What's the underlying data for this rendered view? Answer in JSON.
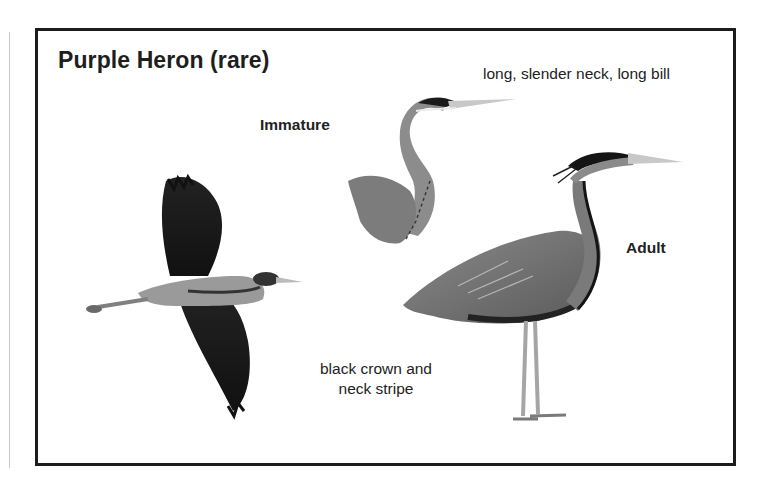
{
  "panel": {
    "title": "Purple Heron (rare)",
    "labels": {
      "immature": "Immature",
      "neck_note": "long, slender neck, long bill",
      "adult": "Adult",
      "crown_note_line1": "black crown and",
      "crown_note_line2": "neck stripe"
    },
    "figures": [
      {
        "name": "flying-heron",
        "description": "Purple heron in flight"
      },
      {
        "name": "immature-heron",
        "description": "Immature purple heron head and neck"
      },
      {
        "name": "adult-heron",
        "description": "Adult purple heron standing"
      }
    ]
  },
  "colors": {
    "border": "#1c1c1c",
    "text": "#1e1e1e",
    "bird_dark": "#1d1d1d",
    "bird_mid": "#707070",
    "bird_light": "#bdbdbd"
  }
}
